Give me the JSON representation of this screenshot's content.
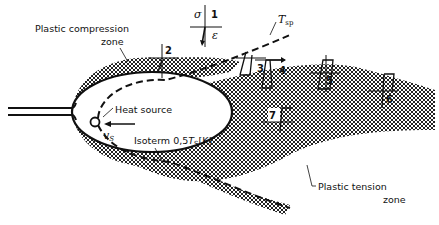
{
  "diagram": {
    "type": "welding thermal-stress zones",
    "labels": {
      "plastic_compression_zone_line1": "Plastic compression",
      "plastic_compression_zone_line2": "zone",
      "heat_source": "Heat source",
      "velocity": "v",
      "velocity_sub": "S",
      "isotherm": "Isoterm 0,5",
      "isotherm_T": "T",
      "isotherm_sub": "S",
      "isotherm_unit": "[K]",
      "t_sp": "T",
      "t_sp_sub": "sp",
      "plastic_tension_zone_line1": "Plastic tension",
      "plastic_tension_zone_line2": "zone",
      "sigma": "σ",
      "epsilon": "ε"
    },
    "points": [
      "1",
      "2",
      "3",
      "4",
      "5",
      "6",
      "7"
    ],
    "colors": {
      "line": "#111111",
      "hatch": "#222222",
      "background": "#ffffff"
    }
  }
}
